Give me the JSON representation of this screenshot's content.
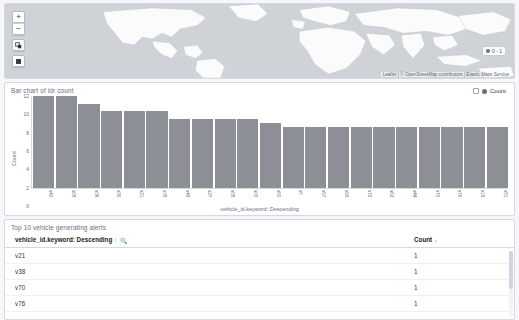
{
  "map": {
    "controls": [
      {
        "name": "zoom-in-button",
        "label": "+"
      },
      {
        "name": "zoom-out-button",
        "label": "−"
      },
      {
        "name": "fit-bounds-button",
        "label": "⧉"
      },
      {
        "name": "draw-rectangle-button",
        "label": "■"
      }
    ],
    "legend": {
      "label": "0 - 1"
    },
    "attribution": "Leaflet | © OpenStreetMap contributors | Elastic Maps Service"
  },
  "chart_panel": {
    "title": "Bar chart of idr count",
    "legend": {
      "label": "Count"
    }
  },
  "chart_data": {
    "type": "bar",
    "title": "Bar chart of idr count",
    "xlabel": "vehicle_id.keyword: Descending",
    "ylabel": "Count",
    "ylim": [
      0,
      12
    ],
    "yticks": [
      "12",
      "10",
      "8",
      "6",
      "4",
      "2",
      "0"
    ],
    "grid": false,
    "legend_position": "top-right",
    "series": [
      {
        "name": "Count",
        "color": "#8c8f95",
        "values": [
          12,
          12,
          11,
          10,
          10,
          10,
          9,
          9,
          9,
          9,
          8.5,
          8,
          8,
          8,
          8,
          8,
          8,
          8,
          8,
          8,
          8
        ]
      }
    ],
    "categories": [
      "v40",
      "v68",
      "v09",
      "v05",
      "v21",
      "v38",
      "v48",
      "v27",
      "v08",
      "v03",
      "v50",
      "v5",
      "v57",
      "v90",
      "v72",
      "v62",
      "v44",
      "v70",
      "v76",
      "v19",
      "v81"
    ]
  },
  "table_panel": {
    "title": "Top 10 vehicle generating alerts",
    "columns": [
      {
        "label": "vehicle_id.keyword: Descending",
        "sortable": true,
        "searchable": true
      },
      {
        "label": "Count",
        "sortable": true,
        "searchable": false
      }
    ],
    "rows": [
      {
        "vehicle": "v21",
        "count": "1"
      },
      {
        "vehicle": "v38",
        "count": "1"
      },
      {
        "vehicle": "v70",
        "count": "1"
      },
      {
        "vehicle": "v76",
        "count": "1"
      }
    ]
  },
  "colors": {
    "bar": "#8c8f95",
    "panel_border": "#d3dae6",
    "map_water": "#cfd3d7",
    "map_land": "#fbfbfb"
  }
}
